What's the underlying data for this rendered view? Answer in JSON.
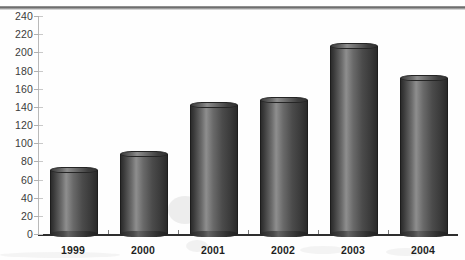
{
  "chart_data": {
    "type": "bar",
    "title": "",
    "subtitle": "",
    "xlabel": "",
    "ylabel": "",
    "categories": [
      "1999",
      "2000",
      "2001",
      "2002",
      "2003",
      "2004"
    ],
    "values": [
      70,
      88,
      142,
      148,
      207,
      172
    ],
    "series": [
      {
        "name": "",
        "values": [
          70,
          88,
          142,
          148,
          207,
          172
        ]
      }
    ],
    "ylim": [
      0,
      240
    ],
    "ytick_step": 20,
    "ytick_labels": [
      "0",
      "20",
      "40",
      "60",
      "80",
      "100",
      "120",
      "140",
      "160",
      "180",
      "200",
      "220",
      "240"
    ],
    "grid": false,
    "legend": false,
    "legend_position": "none",
    "bar_style": "3d-cylinder",
    "bar_color": "#4a4a4a",
    "axis_color": "#2e2e2e",
    "text_color": "#1f1f1f"
  },
  "chart": {
    "axis": {
      "y_title": "",
      "x_title": ""
    }
  }
}
